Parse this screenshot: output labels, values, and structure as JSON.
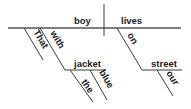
{
  "diagram": {
    "type": "sentence-diagram",
    "sentence_words": {
      "subject": "boy",
      "predicate": "lives",
      "subject_modifier_1": "That",
      "preposition_1": "with",
      "object_1": "jacket",
      "object_1_mod_a": "the",
      "object_1_mod_b": "blue",
      "preposition_2": "on",
      "object_2": "street",
      "object_2_mod": "our"
    },
    "colors": {
      "line": "#3a3a3a",
      "text": "#222222",
      "background": "#ffffff"
    }
  }
}
